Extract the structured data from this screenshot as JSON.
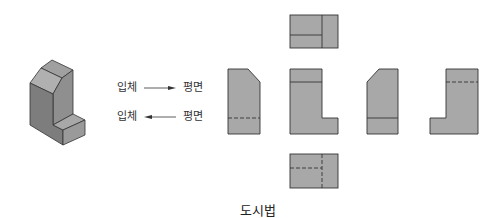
{
  "diagram": {
    "caption": "도시법",
    "rows": [
      {
        "from": "입체",
        "to": "평면",
        "direction": "right"
      },
      {
        "from": "입체",
        "to": "평면",
        "direction": "left"
      }
    ],
    "views": [
      "top-view",
      "side-view-left",
      "front-view",
      "side-view-right",
      "rear-view",
      "bottom-view"
    ],
    "colors": {
      "fill": "#a8a8a8",
      "stroke": "#333333",
      "iso_light": "#b5b5b5",
      "iso_dark": "#8a8a8a"
    }
  }
}
